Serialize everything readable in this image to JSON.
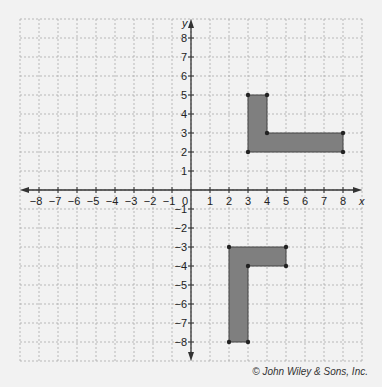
{
  "chart_data": {
    "type": "scatter",
    "title": "",
    "xlabel": "x",
    "ylabel": "y",
    "xlim": [
      -9,
      9
    ],
    "ylim": [
      -9,
      9
    ],
    "grid": true,
    "x_ticks": [
      -8,
      -7,
      -6,
      -5,
      -4,
      -3,
      -2,
      -1,
      1,
      2,
      3,
      4,
      5,
      6,
      7,
      8
    ],
    "y_ticks": [
      8,
      7,
      6,
      5,
      4,
      3,
      2,
      1,
      -1,
      -2,
      -3,
      -4,
      -5,
      -6,
      -7,
      -8
    ],
    "origin_label": "0",
    "series": [
      {
        "name": "upper-L-shape",
        "fill": "#7f7f7f",
        "points": [
          [
            3,
            5
          ],
          [
            4,
            5
          ],
          [
            4,
            3
          ],
          [
            8,
            3
          ],
          [
            8,
            2
          ],
          [
            3,
            2
          ]
        ]
      },
      {
        "name": "lower-L-shape",
        "fill": "#7f7f7f",
        "points": [
          [
            2,
            -3
          ],
          [
            5,
            -3
          ],
          [
            5,
            -4
          ],
          [
            3,
            -4
          ],
          [
            3,
            -8
          ],
          [
            2,
            -8
          ]
        ]
      }
    ]
  },
  "credit": "© John Wiley & Sons, Inc."
}
